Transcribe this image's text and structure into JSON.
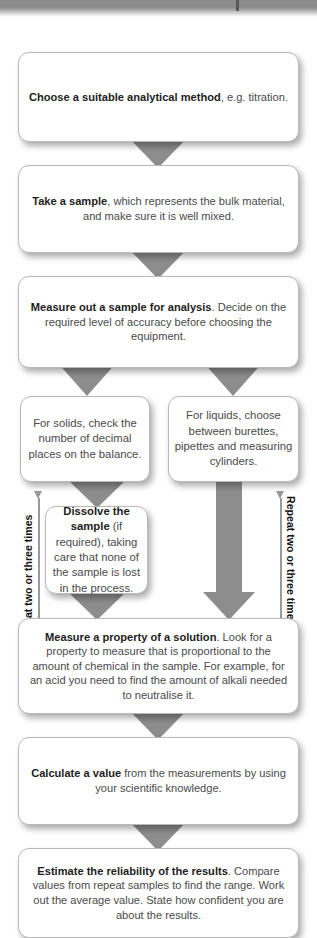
{
  "diagram": {
    "colors": {
      "arrow_grey": "#8d8d8d",
      "box_border": "#b9b9b9",
      "box_fill": "#ffffff",
      "text": "#4a4a4a",
      "bold_text": "#1d1d1d",
      "loop_line": "#9a9a9a"
    },
    "steps": [
      {
        "id": "choose-method",
        "bold": "Choose a suitable analytical method",
        "rest": ", e.g. titration."
      },
      {
        "id": "take-sample",
        "bold": "Take a sample",
        "rest": ", which represents the bulk material, and make sure it is well mixed."
      },
      {
        "id": "measure-out-sample",
        "bold": "Measure out a sample for analysis",
        "rest": ". Decide on the required level of accuracy before choosing the equipment."
      },
      {
        "id": "solids-branch",
        "bold": "",
        "rest": "For solids, check the number of decimal places on the balance."
      },
      {
        "id": "liquids-branch",
        "bold": "",
        "rest": "For liquids, choose between burettes, pipettes and measuring cylinders."
      },
      {
        "id": "dissolve-sample",
        "bold": "Dissolve the sample",
        "rest": " (if required), taking care that none of the sample is lost in the process."
      },
      {
        "id": "measure-property",
        "bold": "Measure a property of a solution",
        "rest": ". Look for a property to measure that is proportional to the amount of chemical in the sample. For example, for an acid you need to find the amount of alkali needed to neutralise it."
      },
      {
        "id": "calculate-value",
        "bold": "Calculate a value",
        "rest": " from the measurements by using your scientific knowledge."
      },
      {
        "id": "estimate-reliability",
        "bold": "Estimate the reliability of the results",
        "rest": ". Compare values from repeat samples to find the range. Work out the average value. State how confident you are about the results."
      }
    ],
    "loops": {
      "left_label": "Repeat two or three times",
      "right_label": "Repeat two or three times"
    }
  }
}
